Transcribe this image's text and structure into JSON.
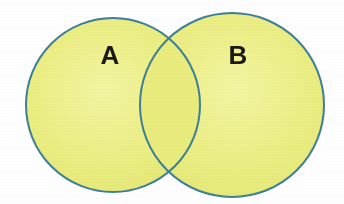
{
  "figure": {
    "kind": "venn-diagram",
    "background_color": "#fefefe",
    "width": 344,
    "height": 204
  },
  "diagram": {
    "fill_color": "#e9ec7d",
    "fill_color_light": "#f2f39a",
    "overlap_fill_color": "#e9ec7d",
    "stroke_color": "#3d7f96",
    "stroke_width": 2,
    "label_color": "#1a1a1a",
    "sets": [
      {
        "id": "set-a",
        "label": "A",
        "cx": 113,
        "cy": 105,
        "r": 87,
        "label_x": 110,
        "label_y": 57
      },
      {
        "id": "set-b",
        "label": "B",
        "cx": 232,
        "cy": 105,
        "r": 92,
        "label_x": 238,
        "label_y": 57
      }
    ],
    "intersection": {
      "id": "set-a-intersect-b",
      "label": "",
      "top_point": {
        "x": 175,
        "y": 42
      },
      "bottom_point": {
        "x": 175,
        "y": 167
      }
    }
  }
}
